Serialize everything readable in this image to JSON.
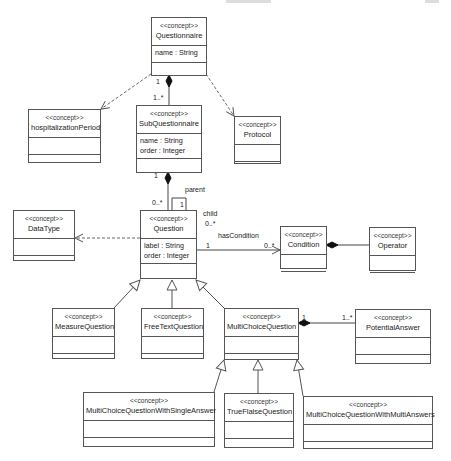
{
  "diagram": {
    "type": "uml-class-diagram",
    "stereotype": "<<concept>>",
    "classes": [
      {
        "id": "questionnaire",
        "name": "Questionnaire",
        "attributes": [
          "name : String"
        ]
      },
      {
        "id": "hospitalizationPeriod",
        "name": "hospitalizationPeriod",
        "attributes": []
      },
      {
        "id": "subQuestionnaire",
        "name": "SubQuestionnaire",
        "attributes": [
          "name : String",
          "order : Integer"
        ]
      },
      {
        "id": "protocol",
        "name": "Protocol",
        "attributes": []
      },
      {
        "id": "dataType",
        "name": "DataType",
        "attributes": []
      },
      {
        "id": "question",
        "name": "Question",
        "attributes": [
          "label : String",
          "order : Integer"
        ]
      },
      {
        "id": "condition",
        "name": "Condition",
        "attributes": []
      },
      {
        "id": "operator",
        "name": "Operator",
        "attributes": []
      },
      {
        "id": "measureQuestion",
        "name": "MeasureQuestion",
        "attributes": []
      },
      {
        "id": "freeTextQuestion",
        "name": "FreeTextQuestion",
        "attributes": []
      },
      {
        "id": "multiChoiceQuestion",
        "name": "MultiChoiceQuestion",
        "attributes": []
      },
      {
        "id": "potentialAnswer",
        "name": "PotentialAnswer",
        "attributes": []
      },
      {
        "id": "mcSingle",
        "name": "MultiChoiceQuestionWithSingleAnswer",
        "attributes": []
      },
      {
        "id": "trueFalse",
        "name": "TrueFlalseQuestion",
        "attributes": []
      },
      {
        "id": "mcMulti",
        "name": "MultiChoiceQuestionWithMultiAnswers",
        "attributes": []
      }
    ],
    "relations": [
      {
        "type": "composition",
        "from": "questionnaire",
        "to": "subQuestionnaire",
        "source_mult": "1",
        "target_mult": "1..*"
      },
      {
        "type": "dependency",
        "from": "questionnaire",
        "to": "hospitalizationPeriod"
      },
      {
        "type": "dependency",
        "from": "questionnaire",
        "to": "protocol"
      },
      {
        "type": "composition",
        "from": "subQuestionnaire",
        "to": "question",
        "source_mult": "1",
        "target_mult": "0..*"
      },
      {
        "type": "self-association",
        "on": "question",
        "role_a": "parent",
        "mult_a": "1",
        "role_b": "child",
        "mult_b": "0..*"
      },
      {
        "type": "dependency",
        "from": "question",
        "to": "dataType"
      },
      {
        "type": "association",
        "from": "question",
        "to": "condition",
        "label": "hasCondition",
        "source_mult": "1",
        "target_mult": "0..*"
      },
      {
        "type": "composition",
        "from": "condition",
        "to": "operator"
      },
      {
        "type": "generalization",
        "from": "measureQuestion",
        "to": "question"
      },
      {
        "type": "generalization",
        "from": "freeTextQuestion",
        "to": "question"
      },
      {
        "type": "generalization",
        "from": "multiChoiceQuestion",
        "to": "question"
      },
      {
        "type": "composition",
        "from": "multiChoiceQuestion",
        "to": "potentialAnswer",
        "source_mult": "1",
        "target_mult": "1..*"
      },
      {
        "type": "generalization",
        "from": "mcSingle",
        "to": "multiChoiceQuestion"
      },
      {
        "type": "generalization",
        "from": "trueFalse",
        "to": "multiChoiceQuestion"
      },
      {
        "type": "generalization",
        "from": "mcMulti",
        "to": "multiChoiceQuestion"
      }
    ],
    "labels": {
      "q_sub_src": "1",
      "q_sub_tgt": "1..*",
      "sub_q_src": "1",
      "sub_q_tgt": "0..*",
      "parent": "parent",
      "parent_mult": "1",
      "child": "child",
      "child_mult": "0..*",
      "hasCondition": "hasCondition",
      "hc_src": "1",
      "hc_tgt": "0..*",
      "mcq_pa_src": "1",
      "mcq_pa_tgt": "1..*"
    }
  }
}
